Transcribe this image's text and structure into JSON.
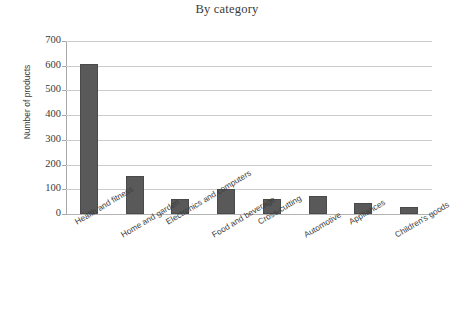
{
  "chart_data": {
    "type": "bar",
    "title": "By category",
    "xlabel": "",
    "ylabel": "Number of products",
    "categories": [
      "Health and fitness",
      "Home and garden",
      "Electronics and computers",
      "Food and  beverage",
      "Cross-cutting",
      "Automotive",
      "Appliances",
      "Children's goods"
    ],
    "values": [
      608,
      152,
      60,
      103,
      60,
      73,
      45,
      27
    ],
    "ylim": [
      0,
      700
    ],
    "yticks": [
      0,
      100,
      200,
      300,
      400,
      500,
      600,
      700
    ],
    "ytick_labels": [
      "0",
      "100",
      "200",
      "300",
      "400",
      "500",
      "600",
      "700"
    ],
    "grid": true,
    "legend": false,
    "bar_color": "#595959",
    "gridline_color": "#cccccc",
    "background_color": "#ffffff"
  }
}
